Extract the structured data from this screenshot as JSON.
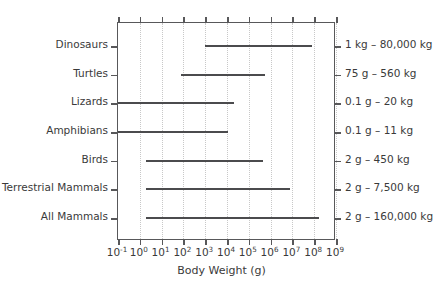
{
  "chart_data": {
    "type": "bar",
    "orientation": "horizontal-range",
    "title": "",
    "xlabel": "Body Weight (g)",
    "ylabel": "",
    "xscale": "log",
    "xlim": [
      0.1,
      1000000000
    ],
    "grid": true,
    "legend": false,
    "xticks": [
      {
        "value": 0.1,
        "mantissa": "10",
        "exponent": "-1"
      },
      {
        "value": 1,
        "mantissa": "10",
        "exponent": "0"
      },
      {
        "value": 10,
        "mantissa": "10",
        "exponent": "1"
      },
      {
        "value": 100,
        "mantissa": "10",
        "exponent": "2"
      },
      {
        "value": 1000,
        "mantissa": "10",
        "exponent": "3"
      },
      {
        "value": 10000,
        "mantissa": "10",
        "exponent": "4"
      },
      {
        "value": 100000,
        "mantissa": "10",
        "exponent": "5"
      },
      {
        "value": 1000000,
        "mantissa": "10",
        "exponent": "6"
      },
      {
        "value": 10000000,
        "mantissa": "10",
        "exponent": "7"
      },
      {
        "value": 100000000,
        "mantissa": "10",
        "exponent": "8"
      },
      {
        "value": 1000000000,
        "mantissa": "10",
        "exponent": "9"
      }
    ],
    "categories": [
      "Dinosaurs",
      "Turtles",
      "Lizards",
      "Amphibians",
      "Birds",
      "Terrestrial Mammals",
      "All Mammals"
    ],
    "rows": [
      {
        "category": "Dinosaurs",
        "min_g": 1000,
        "max_g": 80000000,
        "annotation": "1 kg – 80,000 kg"
      },
      {
        "category": "Turtles",
        "min_g": 75,
        "max_g": 560000,
        "annotation": "75 g – 560 kg"
      },
      {
        "category": "Lizards",
        "min_g": 0.1,
        "max_g": 20000,
        "annotation": "0.1 g – 20 kg"
      },
      {
        "category": "Amphibians",
        "min_g": 0.1,
        "max_g": 11000,
        "annotation": "0.1 g – 11 kg"
      },
      {
        "category": "Birds",
        "min_g": 2,
        "max_g": 450000,
        "annotation": "2 g – 450 kg"
      },
      {
        "category": "Terrestrial Mammals",
        "min_g": 2,
        "max_g": 7500000,
        "annotation": "2 g – 7,500 kg"
      },
      {
        "category": "All Mammals",
        "min_g": 2,
        "max_g": 160000000,
        "annotation": "2 g – 160,000 kg"
      }
    ],
    "colors": {
      "bar": "#4b4b4d",
      "frame": "#58585a",
      "grid": "#c8c8c8",
      "text": "#3a3a3a",
      "background": "#ffffff"
    }
  }
}
